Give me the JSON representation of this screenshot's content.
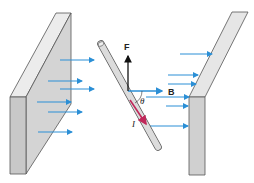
{
  "diagram": {
    "labels": {
      "force": "F",
      "field": "B",
      "angle": "θ",
      "current": "I"
    },
    "colors": {
      "field_arrows": "#2b8fd6",
      "current_arrow": "#c0285a",
      "poles": "#d9d9d9",
      "pole_edge": "#555555",
      "force_arrow": "#111111"
    }
  }
}
